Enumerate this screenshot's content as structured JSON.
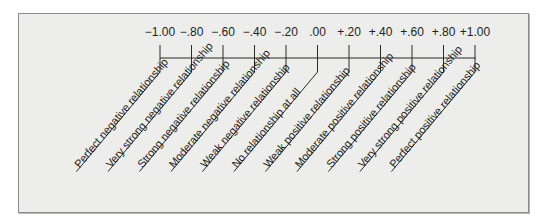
{
  "diagram": {
    "title": "",
    "scale": {
      "ticks": [
        {
          "value": "−1.00",
          "label": "Perfect negative relationship"
        },
        {
          "value": "−.80",
          "label": "Very strong negative relationship"
        },
        {
          "value": "−.60",
          "label": "Strong negative relationship"
        },
        {
          "value": "−.40",
          "label": "Moderate negative relationship"
        },
        {
          "value": "−.20",
          "label": "Weak negative relationship"
        },
        {
          "value": ".00",
          "label": "No relationship at all"
        },
        {
          "value": "+.20",
          "label": "Weak positive relationship"
        },
        {
          "value": "+.40",
          "label": "Moderate positive relationship"
        },
        {
          "value": "+.60",
          "label": "Strong positive relationship"
        },
        {
          "value": "+.80",
          "label": "Very strong positive relationship"
        },
        {
          "value": "+1.00",
          "label": "Perfect positive relationship"
        }
      ]
    },
    "colors": {
      "background": "#ededeb",
      "border": "#8c8c8c",
      "ink": "#1e1e1e"
    }
  }
}
